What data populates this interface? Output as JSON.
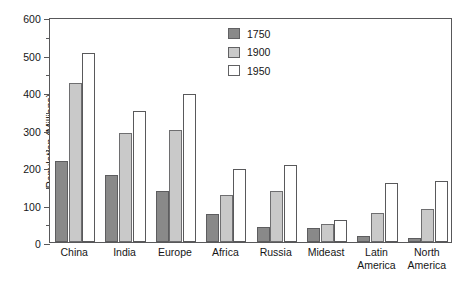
{
  "chart_data": {
    "type": "bar",
    "title": "",
    "xlabel": "",
    "ylabel": "Population (Millions)",
    "ylim": [
      0,
      600
    ],
    "ytick_step": 100,
    "yminor_step": 50,
    "grid": false,
    "legend_position": "top-center",
    "categories": [
      "China",
      "India",
      "Europe",
      "Africa",
      "Russia",
      "Mideast",
      "Latin America",
      "North America"
    ],
    "category_lines": [
      [
        "China"
      ],
      [
        "India"
      ],
      [
        "Europe"
      ],
      [
        "Africa"
      ],
      [
        "Russia"
      ],
      [
        "Mideast"
      ],
      [
        "Latin",
        "America"
      ],
      [
        "North",
        "America"
      ]
    ],
    "ytick_labels": [
      "0",
      "100",
      "200",
      "300",
      "400",
      "500",
      "600"
    ],
    "ytick_values": [
      0,
      100,
      200,
      300,
      400,
      500,
      600
    ],
    "series": [
      {
        "name": "1750",
        "color": "#898989",
        "values": [
          215,
          180,
          135,
          75,
          40,
          37,
          15,
          10
        ]
      },
      {
        "name": "1900",
        "color": "#c9c9c9",
        "values": [
          425,
          290,
          300,
          125,
          135,
          48,
          77,
          88
        ]
      },
      {
        "name": "1950",
        "color": "#ffffff",
        "values": [
          505,
          350,
          395,
          195,
          205,
          60,
          158,
          163
        ]
      }
    ]
  },
  "legend": {
    "items": [
      {
        "label": "1750",
        "swatch": "#898989"
      },
      {
        "label": "1900",
        "swatch": "#c9c9c9"
      },
      {
        "label": "1950",
        "swatch": "#ffffff"
      }
    ]
  },
  "axes": {
    "y_title": "Population (Millions)"
  }
}
